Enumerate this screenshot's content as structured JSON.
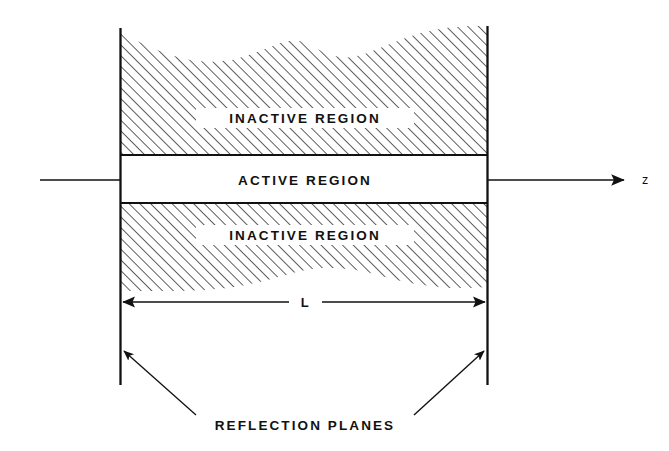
{
  "figure": {
    "background_color": "#ffffff",
    "line_color": "#111111",
    "hatch_color": "#2b2b2b"
  },
  "regions": {
    "upper_inactive": {
      "label": "INACTIVE REGION",
      "fill": "hatched",
      "hatch_angle_deg": 45
    },
    "active": {
      "label": "ACTIVE REGION",
      "fill": "white"
    },
    "lower_inactive": {
      "label": "INACTIVE REGION",
      "fill": "hatched",
      "hatch_angle_deg": 45
    }
  },
  "axis": {
    "label": "z",
    "direction": "right",
    "arrow": "arrow-right-icon"
  },
  "dimension": {
    "label": "L",
    "style": "double-headed-arrow",
    "arrow_left": "arrow-left-icon",
    "arrow_right": "arrow-right-icon"
  },
  "annotation": {
    "label": "REFLECTION PLANES",
    "leader_left": "leader-arrow-up-left-icon",
    "leader_right": "leader-arrow-up-right-icon"
  }
}
